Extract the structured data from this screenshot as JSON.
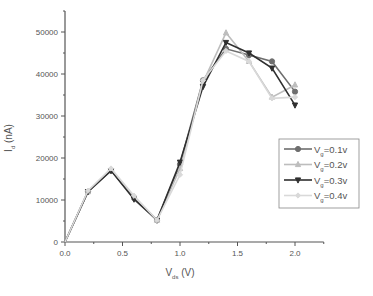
{
  "chart_data": {
    "type": "line",
    "title": "",
    "xlabel": "V_ds (V)",
    "ylabel": "I_d (nA)",
    "xlabel_main": "V",
    "xlabel_sub": "ds",
    "xlabel_unit": " (V)",
    "ylabel_main": "I",
    "ylabel_sub": "d",
    "ylabel_unit": " (nA)",
    "xlim": [
      0,
      2.25
    ],
    "ylim": [
      0,
      55000
    ],
    "grid": false,
    "legend_position": "right-center",
    "x_ticks": [
      "0.0",
      "0.5",
      "1.0",
      "1.5",
      "2.0"
    ],
    "y_ticks": [
      "0",
      "10000",
      "20000",
      "30000",
      "40000",
      "50000"
    ],
    "x": [
      0.0,
      0.2,
      0.4,
      0.6,
      0.8,
      1.0,
      1.2,
      1.4,
      1.6,
      1.8,
      2.0
    ],
    "series": [
      {
        "name": "Vg=0.1v",
        "label_main": "V",
        "label_sub": "g",
        "label_rest": "=0.1v",
        "marker": "circle",
        "color": "#6e6e6e",
        "values": [
          0,
          12000,
          17000,
          10500,
          5200,
          18500,
          38500,
          46000,
          44500,
          43000,
          35800
        ]
      },
      {
        "name": "Vg=0.2v",
        "label_main": "V",
        "label_sub": "g",
        "label_rest": "=0.2v",
        "marker": "triangle-up",
        "color": "#bdbdbd",
        "values": [
          0,
          12000,
          17200,
          10800,
          5200,
          17500,
          38000,
          49800,
          43000,
          34500,
          37400
        ]
      },
      {
        "name": "Vg=0.3v",
        "label_main": "V",
        "label_sub": "g",
        "label_rest": "=0.3v",
        "marker": "triangle-down",
        "color": "#2f2f2f",
        "values": [
          0,
          12000,
          17000,
          10200,
          5200,
          19000,
          37000,
          47500,
          45000,
          41400,
          32600
        ]
      },
      {
        "name": "Vg=0.4v",
        "label_main": "V",
        "label_sub": "g",
        "label_rest": "=0.4v",
        "marker": "diamond",
        "color": "#d9d9d9",
        "values": [
          0,
          12200,
          17500,
          11000,
          5200,
          16000,
          38500,
          45500,
          43000,
          34200,
          34500
        ]
      }
    ]
  }
}
